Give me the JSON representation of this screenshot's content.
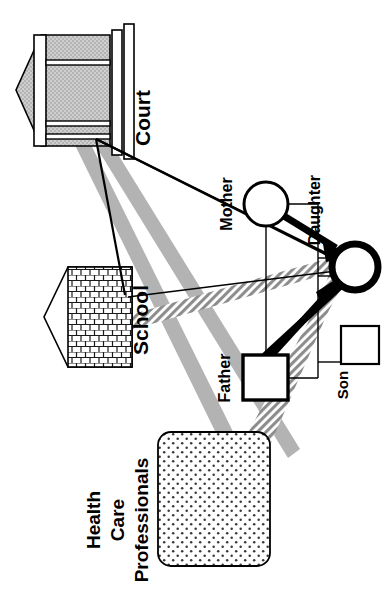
{
  "diagram": {
    "kind": "ecomap-genogram",
    "orientation": "rotated-90-clockwise",
    "background_color": "#ffffff",
    "ink_color": "#000000",
    "band_solid_color": "#b3b3b3",
    "band_hatch_color": "#9a9a9a",
    "court_fill_color": "#c9c9c9"
  },
  "external_systems": [
    {
      "id": "court",
      "label": "Court",
      "shape": "pentagon-building",
      "fill": "solid-gray"
    },
    {
      "id": "school",
      "label": "School",
      "shape": "pentagon-building",
      "fill": "brick-hatch"
    },
    {
      "id": "health_care",
      "label_lines": [
        "Health",
        "Care",
        "Professionals"
      ],
      "label": "Health Care Professionals",
      "shape": "rounded-rectangle",
      "fill": "dot-stipple"
    }
  ],
  "family_members": [
    {
      "id": "mother",
      "label": "Mother",
      "symbol": "circle",
      "stroke": "medium"
    },
    {
      "id": "father",
      "label": "Father",
      "symbol": "square",
      "stroke": "bold"
    },
    {
      "id": "daughter",
      "label": "Daughter",
      "symbol": "circle",
      "stroke": "extra-bold",
      "is_index_client": true
    },
    {
      "id": "son",
      "label": "Son",
      "symbol": "square",
      "stroke": "thin"
    }
  ],
  "relationship_links": [
    {
      "from": "mother",
      "to": "daughter",
      "style": "thick-arrow",
      "meaning": "strong-directional"
    },
    {
      "from": "father",
      "to": "daughter",
      "style": "thick-arrow",
      "meaning": "strong-directional"
    },
    {
      "from": "daughter",
      "to": "father",
      "style": "thick-arrow",
      "meaning": "strong-directional"
    },
    {
      "from": "mother",
      "to": "father",
      "style": "thin-line",
      "meaning": "marital-bond"
    },
    {
      "from": "mother",
      "to": "son",
      "style": "thin-line",
      "meaning": "parental"
    },
    {
      "from": "father",
      "to": "son",
      "style": "thin-line",
      "meaning": "parental"
    }
  ],
  "system_links": [
    {
      "from": "court",
      "to": "mother",
      "style": "thin-line",
      "meaning": "weak-tie"
    },
    {
      "from": "court",
      "to": "daughter",
      "style": "thin-line",
      "meaning": "weak-tie"
    },
    {
      "from": "court",
      "to": "school",
      "style": "thin-line",
      "meaning": "weak-tie"
    },
    {
      "from": "court",
      "to": "father",
      "style": "solid-band",
      "meaning": "strong-tie"
    },
    {
      "from": "court",
      "to": "health_care",
      "style": "solid-band",
      "meaning": "strong-tie"
    },
    {
      "from": "school",
      "to": "daughter",
      "style": "hatch-band",
      "meaning": "stressful-tie"
    },
    {
      "from": "health_care",
      "to": "daughter",
      "style": "hatch-band",
      "meaning": "stressful-tie"
    },
    {
      "from": "health_care",
      "to": "son",
      "style": "hatch-band",
      "meaning": "stressful-tie"
    }
  ]
}
